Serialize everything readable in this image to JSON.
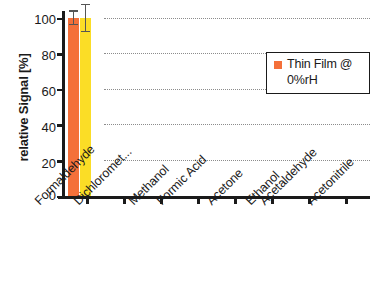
{
  "chart_data": {
    "type": "bar",
    "title": "",
    "subtitle": "",
    "xlabel": "",
    "ylabel": "relative Signal [%]",
    "ylim": [
      0,
      100
    ],
    "yticks": [
      0,
      20,
      40,
      60,
      80,
      100
    ],
    "ytick_labels": [
      "0",
      "20",
      "40",
      "60",
      "80",
      "100"
    ],
    "grid": "horizontal-dotted",
    "legend_position": "right-upper",
    "categories": [
      "Formaldehyde",
      "Dichloromet...",
      "Methanol",
      "Formic Acid",
      "Acetone",
      "Ethanol",
      "Acetaldehyde",
      "Acetonitrile"
    ],
    "series": [
      {
        "name": "Thin Film @ 0%rH",
        "color": "#f4703a",
        "values": [
          100,
          0,
          0,
          0,
          0,
          0,
          0,
          0
        ],
        "errors": [
          4,
          0,
          0,
          0,
          0,
          0,
          0,
          0
        ]
      },
      {
        "name": "",
        "color": "#fbdd26",
        "values": [
          100,
          0,
          0,
          0,
          0,
          0,
          0,
          0
        ],
        "errors": [
          8,
          0,
          0,
          0,
          0,
          0,
          0,
          0
        ]
      }
    ],
    "legend": [
      {
        "label": "Thin Film @ 0%rH",
        "color": "#f4703a",
        "marker": "square"
      }
    ],
    "colors": {
      "series_a": "#f4703a",
      "series_b": "#fbdd26",
      "axis": "#1a1a1a",
      "grid": "#8c8c8c",
      "error": "#555555",
      "background": "#ffffff"
    }
  },
  "legend_panel": {
    "line1": "Thin Film @",
    "line2": "0%rH"
  }
}
